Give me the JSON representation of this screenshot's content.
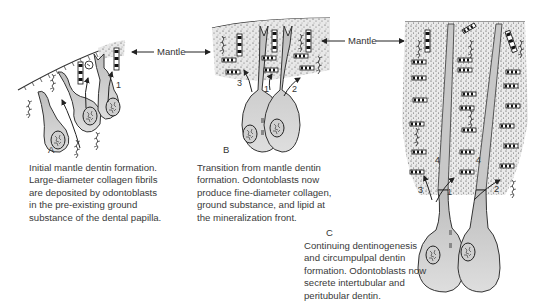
{
  "figure": {
    "panels": [
      {
        "id": "A",
        "label": "A",
        "numbers": [
          "1"
        ],
        "caption": "Initial mantle dentin formation.\nLarge-diameter collagen fibrils\nare deposited by odontoblasts\nin the pre-existing ground\nsubstance of the dental papilla."
      },
      {
        "id": "B",
        "label": "B",
        "numbers": [
          "3",
          "1",
          "2"
        ],
        "caption": "Transition from mantle dentin\nformation. Odontoblasts now\nproduce fine-diameter collagen,\nground substance, and lipid at\nthe mineralization front."
      },
      {
        "id": "C",
        "label": "C",
        "numbers": [
          "4",
          "4",
          "3",
          "1",
          "2"
        ],
        "caption": "Continuing dentinogenesis\nand circumpulpal dentin\nformation. Odontoblasts now\nsecrete intertubular and\nperitubular dentin."
      }
    ],
    "annotations": {
      "mantle_left": "Mantle",
      "mantle_right": "Mantle"
    },
    "colors": {
      "cell_fill": "#d4d4d4",
      "matrix_fill": "#e6e6e6",
      "line": "#333333",
      "background": "#ffffff"
    }
  }
}
